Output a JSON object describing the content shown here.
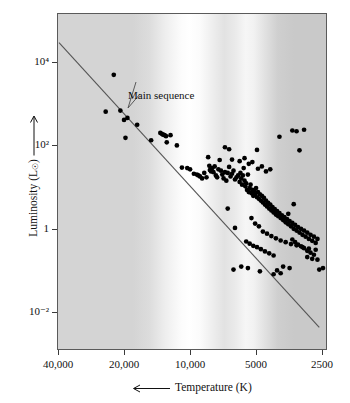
{
  "figure": {
    "kind": "hertzsprung-russell-diagram",
    "background_note": "stellar-spectrum-gradient"
  },
  "axes": {
    "y_title_prefix": "Luminosity (L",
    "y_title_sun": "☉",
    "y_title_suffix": ")",
    "y_arrow": "↑",
    "x_title": "Temperature (K)",
    "x_arrow": "←"
  },
  "annotations": [
    {
      "name": "main-sequence",
      "text": "Main sequence",
      "x": 128,
      "y": 89
    }
  ],
  "chart_data": {
    "type": "scatter",
    "title": "",
    "subtitle": "",
    "xlabel": "Temperature (K)",
    "ylabel": "Luminosity (L☉)",
    "xscale": "log-reversed",
    "yscale": "log",
    "xlim": [
      40000,
      2300
    ],
    "ylim": [
      0.0028,
      63000
    ],
    "grid": false,
    "legend": "none",
    "xticks": [
      40000,
      20000,
      10000,
      5000,
      2500
    ],
    "xticklabels": [
      "40,000",
      "20,000",
      "10,000",
      "5000",
      "2500"
    ],
    "yticks": [
      10000,
      100,
      1,
      0.01
    ],
    "yticklabels": [
      "10⁴",
      "10²",
      "1",
      "10⁻²"
    ],
    "series": [
      {
        "name": "main sequence line",
        "type": "line",
        "points": [
          [
            40000,
            31000
          ],
          [
            2600,
            0.0045
          ]
        ]
      },
      {
        "name": "stars",
        "type": "scatter",
        "marker": "filled-circle",
        "color": "#000000",
        "points": [
          [
            22500,
            5200
          ],
          [
            24500,
            680
          ],
          [
            21000,
            720
          ],
          [
            20200,
            430
          ],
          [
            19900,
            160
          ],
          [
            19500,
            480
          ],
          [
            17600,
            330
          ],
          [
            15200,
            140
          ],
          [
            13800,
            210
          ],
          [
            13600,
            200
          ],
          [
            13400,
            190
          ],
          [
            13200,
            185
          ],
          [
            13000,
            175
          ],
          [
            12900,
            125
          ],
          [
            12400,
            185
          ],
          [
            11600,
            105
          ],
          [
            11000,
            31
          ],
          [
            10400,
            30
          ],
          [
            10100,
            28
          ],
          [
            9700,
            22
          ],
          [
            9400,
            21
          ],
          [
            9250,
            20
          ],
          [
            9100,
            19
          ],
          [
            8900,
            17
          ],
          [
            8700,
            23
          ],
          [
            8500,
            18
          ],
          [
            8350,
            55
          ],
          [
            8250,
            34
          ],
          [
            8200,
            27
          ],
          [
            8100,
            25
          ],
          [
            8000,
            30
          ],
          [
            7900,
            24
          ],
          [
            7800,
            33
          ],
          [
            7700,
            20
          ],
          [
            7600,
            18
          ],
          [
            7500,
            28
          ],
          [
            7400,
            47
          ],
          [
            7300,
            26
          ],
          [
            7200,
            21
          ],
          [
            7100,
            17
          ],
          [
            7000,
            24
          ],
          [
            6900,
            15
          ],
          [
            6800,
            23
          ],
          [
            6700,
            32
          ],
          [
            6600,
            19
          ],
          [
            6500,
            22
          ],
          [
            6400,
            26
          ],
          [
            6300,
            16
          ],
          [
            6200,
            18
          ],
          [
            6100,
            20
          ],
          [
            6000,
            14
          ],
          [
            5950,
            23
          ],
          [
            5900,
            17
          ],
          [
            5850,
            12
          ],
          [
            5800,
            20
          ],
          [
            5750,
            30
          ],
          [
            5700,
            15
          ],
          [
            5650,
            11
          ],
          [
            5600,
            13
          ],
          [
            5550,
            9
          ],
          [
            5500,
            21
          ],
          [
            5450,
            8
          ],
          [
            5400,
            10
          ],
          [
            5350,
            12
          ],
          [
            5300,
            7.5
          ],
          [
            5250,
            9
          ],
          [
            5200,
            6.5
          ],
          [
            5150,
            8.5
          ],
          [
            5100,
            7
          ],
          [
            5050,
            10
          ],
          [
            5000,
            6
          ],
          [
            4950,
            8
          ],
          [
            4900,
            5.5
          ],
          [
            4850,
            7
          ],
          [
            4800,
            5
          ],
          [
            4750,
            6.5
          ],
          [
            4700,
            4.5
          ],
          [
            4650,
            5.8
          ],
          [
            4600,
            4
          ],
          [
            4550,
            5
          ],
          [
            4500,
            3.6
          ],
          [
            4450,
            4.4
          ],
          [
            4400,
            3.2
          ],
          [
            4350,
            4
          ],
          [
            4300,
            2.9
          ],
          [
            4250,
            3.5
          ],
          [
            4200,
            2.6
          ],
          [
            4150,
            3.1
          ],
          [
            4100,
            2.3
          ],
          [
            4050,
            2.8
          ],
          [
            4000,
            2.1
          ],
          [
            3950,
            2.5
          ],
          [
            3900,
            1.9
          ],
          [
            3850,
            2.2
          ],
          [
            3800,
            1.7
          ],
          [
            3750,
            2
          ],
          [
            3700,
            1.5
          ],
          [
            3650,
            1.8
          ],
          [
            3600,
            1.35
          ],
          [
            3550,
            1.6
          ],
          [
            3500,
            1.2
          ],
          [
            3450,
            1.45
          ],
          [
            3400,
            1.05
          ],
          [
            3350,
            1.3
          ],
          [
            3300,
            0.95
          ],
          [
            3250,
            1.15
          ],
          [
            3200,
            0.85
          ],
          [
            3150,
            1.05
          ],
          [
            3100,
            0.75
          ],
          [
            3050,
            0.95
          ],
          [
            3000,
            0.68
          ],
          [
            2950,
            0.85
          ],
          [
            2900,
            0.6
          ],
          [
            2850,
            0.75
          ],
          [
            2800,
            0.54
          ],
          [
            2750,
            0.68
          ],
          [
            2700,
            0.48
          ],
          [
            2650,
            0.6
          ],
          [
            6800,
            3.2
          ],
          [
            6300,
            1.1
          ],
          [
            5300,
            1.9
          ],
          [
            5100,
            1.4
          ],
          [
            4900,
            1.2
          ],
          [
            4700,
            0.9
          ],
          [
            4500,
            0.8
          ],
          [
            4300,
            0.7
          ],
          [
            4100,
            0.62
          ],
          [
            3900,
            0.55
          ],
          [
            3700,
            0.5
          ],
          [
            3500,
            0.45
          ],
          [
            3300,
            0.42
          ],
          [
            3100,
            0.38
          ],
          [
            2900,
            0.35
          ],
          [
            2700,
            0.33
          ],
          [
            5600,
            0.52
          ],
          [
            5400,
            0.46
          ],
          [
            5200,
            0.41
          ],
          [
            5000,
            0.38
          ],
          [
            4800,
            0.34
          ],
          [
            4600,
            0.3
          ],
          [
            4400,
            0.27
          ],
          [
            4200,
            0.24
          ],
          [
            3450,
            0.58
          ],
          [
            3350,
            0.5
          ],
          [
            3250,
            0.44
          ],
          [
            3150,
            0.4
          ],
          [
            3050,
            0.36
          ],
          [
            2950,
            0.31
          ],
          [
            2850,
            0.28
          ],
          [
            2750,
            0.25
          ],
          [
            5900,
            0.13
          ],
          [
            5500,
            0.12
          ],
          [
            4850,
            0.1
          ],
          [
            6400,
            0.11
          ],
          [
            3800,
            0.13
          ],
          [
            3550,
            0.12
          ],
          [
            4050,
            0.105
          ],
          [
            2600,
            0.11
          ],
          [
            6700,
            85
          ],
          [
            5000,
            82
          ],
          [
            3950,
            170
          ],
          [
            3450,
            240
          ],
          [
            3300,
            230
          ],
          [
            3200,
            80
          ],
          [
            3050,
            250
          ],
          [
            3400,
            4.1
          ],
          [
            3600,
            2.4
          ],
          [
            7000,
            95
          ],
          [
            6500,
            48
          ],
          [
            6000,
            44
          ],
          [
            5700,
            52
          ],
          [
            5450,
            38
          ],
          [
            5250,
            42
          ],
          [
            4950,
            29
          ],
          [
            4750,
            33
          ],
          [
            4550,
            25
          ],
          [
            4350,
            28
          ],
          [
            2950,
            0.22
          ],
          [
            2800,
            0.2
          ],
          [
            2650,
            0.19
          ],
          [
            2500,
            0.12
          ],
          [
            3900,
            0.09
          ],
          [
            4200,
            0.085
          ]
        ]
      }
    ]
  }
}
